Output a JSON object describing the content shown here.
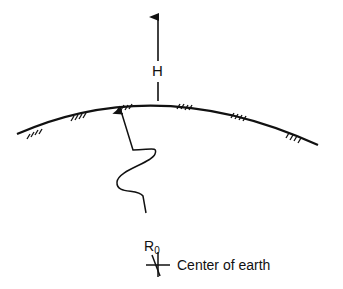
{
  "diagram": {
    "labels": {
      "height": "H",
      "radius_main": "R",
      "radius_sub": "0",
      "center": "Center of earth"
    },
    "elements": {
      "earth_surface": "curved arc with ground hatching",
      "altitude_arrow": "vertical arrow pointing up from surface, labeled H",
      "radius_path": "wavy line from earth center to surface with arrowhead, labeled R0",
      "center_marker": "cross marking the center of earth"
    },
    "colors": {
      "stroke": "#111111",
      "background": "#ffffff"
    }
  }
}
